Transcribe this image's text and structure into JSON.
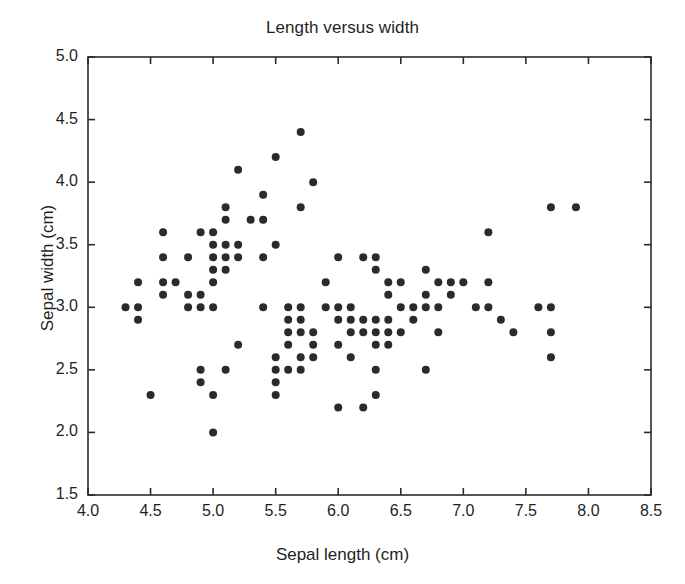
{
  "chart_data": {
    "type": "scatter",
    "title": "Length versus width",
    "xlabel": "Sepal length (cm)",
    "ylabel": "Sepal width (cm)",
    "xlim": [
      4.0,
      8.5
    ],
    "ylim": [
      1.5,
      5.0
    ],
    "xticks": [
      "4.0",
      "4.5",
      "5.0",
      "5.5",
      "6.0",
      "6.5",
      "7.0",
      "7.5",
      "8.0",
      "8.5"
    ],
    "xtick_values": [
      4.0,
      4.5,
      5.0,
      5.5,
      6.0,
      6.5,
      7.0,
      7.5,
      8.0,
      8.5
    ],
    "yticks": [
      "1.5",
      "2.0",
      "2.5",
      "3.0",
      "3.5",
      "4.0",
      "4.5",
      "5.0"
    ],
    "ytick_values": [
      1.5,
      2.0,
      2.5,
      3.0,
      3.5,
      4.0,
      4.5,
      5.0
    ],
    "grid": false,
    "legend": false,
    "marker": {
      "shape": "circle",
      "color": "#2b2b2b",
      "size_px": 8
    },
    "frame_color": "#2b2b2b",
    "background": "#ffffff",
    "series": [
      {
        "name": "Iris sepal measurements",
        "x": [
          5.1,
          4.9,
          4.7,
          4.6,
          5.0,
          5.4,
          4.6,
          5.0,
          4.4,
          4.9,
          5.4,
          4.8,
          4.8,
          4.3,
          5.8,
          5.7,
          5.4,
          5.1,
          5.7,
          5.1,
          5.4,
          5.1,
          4.6,
          5.1,
          4.8,
          5.0,
          5.0,
          5.2,
          5.2,
          4.7,
          4.8,
          5.4,
          5.2,
          5.5,
          4.9,
          5.0,
          5.5,
          4.9,
          4.4,
          5.1,
          5.0,
          4.5,
          4.4,
          5.0,
          5.1,
          4.8,
          5.1,
          4.6,
          5.3,
          5.0,
          7.0,
          6.4,
          6.9,
          5.5,
          6.5,
          5.7,
          6.3,
          4.9,
          6.6,
          5.2,
          5.0,
          5.9,
          6.0,
          6.1,
          5.6,
          6.7,
          5.6,
          5.8,
          6.2,
          5.6,
          5.9,
          6.1,
          6.3,
          6.1,
          6.4,
          6.6,
          6.8,
          6.7,
          6.0,
          5.7,
          5.5,
          5.5,
          5.8,
          6.0,
          5.4,
          6.0,
          6.7,
          6.3,
          5.6,
          5.5,
          5.5,
          6.1,
          5.8,
          5.0,
          5.6,
          5.7,
          5.7,
          6.2,
          5.1,
          5.7,
          6.3,
          5.8,
          7.1,
          6.3,
          6.5,
          7.6,
          4.9,
          7.3,
          6.7,
          7.2,
          6.5,
          6.4,
          6.8,
          5.7,
          5.8,
          6.4,
          6.5,
          7.7,
          7.7,
          6.0,
          6.9,
          5.6,
          7.7,
          6.3,
          6.7,
          7.2,
          6.2,
          6.1,
          6.4,
          7.2,
          7.4,
          7.9,
          6.4,
          6.3,
          6.1,
          7.7,
          6.3,
          6.4,
          6.0,
          6.9,
          6.7,
          6.9,
          5.8,
          6.8,
          6.7,
          6.7,
          6.3,
          6.5,
          6.2,
          5.9
        ],
        "y": [
          3.5,
          3.0,
          3.2,
          3.1,
          3.6,
          3.9,
          3.4,
          3.4,
          2.9,
          3.1,
          3.7,
          3.4,
          3.0,
          3.0,
          4.0,
          4.4,
          3.9,
          3.5,
          3.8,
          3.8,
          3.4,
          3.7,
          3.6,
          3.3,
          3.4,
          3.0,
          3.4,
          3.5,
          3.4,
          3.2,
          3.1,
          3.4,
          4.1,
          4.2,
          3.1,
          3.2,
          3.5,
          3.6,
          3.0,
          3.4,
          3.5,
          2.3,
          3.2,
          3.5,
          3.8,
          3.0,
          3.8,
          3.2,
          3.7,
          3.3,
          3.2,
          3.2,
          3.1,
          2.3,
          2.8,
          2.8,
          3.3,
          2.4,
          2.9,
          2.7,
          2.0,
          3.0,
          2.2,
          2.9,
          2.9,
          3.1,
          3.0,
          2.7,
          2.2,
          2.5,
          3.2,
          2.8,
          2.5,
          2.8,
          2.9,
          3.0,
          2.8,
          3.0,
          2.9,
          2.6,
          2.4,
          2.4,
          2.7,
          2.7,
          3.0,
          3.4,
          3.1,
          2.3,
          3.0,
          2.5,
          2.6,
          3.0,
          2.6,
          2.3,
          2.7,
          3.0,
          2.9,
          2.9,
          2.5,
          2.8,
          3.3,
          2.7,
          3.0,
          2.9,
          3.0,
          3.0,
          2.5,
          2.9,
          2.5,
          3.6,
          3.2,
          2.7,
          3.0,
          2.5,
          2.8,
          3.2,
          3.0,
          3.8,
          2.6,
          2.2,
          3.2,
          2.8,
          2.8,
          2.7,
          3.3,
          3.2,
          2.8,
          3.0,
          2.8,
          3.0,
          2.8,
          3.8,
          2.8,
          2.8,
          2.6,
          3.0,
          3.4,
          3.1,
          3.0,
          3.1,
          3.1,
          3.1,
          2.7,
          3.2,
          3.3,
          3.0,
          2.5,
          3.0,
          3.4,
          3.0
        ]
      }
    ]
  }
}
